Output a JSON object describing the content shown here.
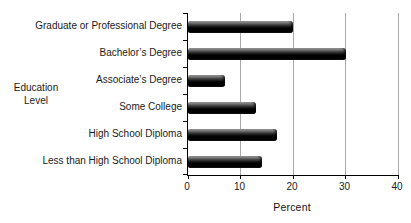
{
  "chart_data": {
    "type": "bar",
    "orientation": "horizontal",
    "title": "",
    "categories": [
      "Graduate or Professional Degree",
      "Bachelor’s Degree",
      "Associate’s Degree",
      "Some College",
      "High School Diploma",
      "Less than High School Diploma"
    ],
    "values": [
      20,
      30,
      7,
      13,
      17,
      14
    ],
    "xlabel": "Percent",
    "ylabel": "Education Level",
    "xlim": [
      0,
      40
    ],
    "xticks": [
      0,
      10,
      20,
      30,
      40
    ],
    "grid": true,
    "legend": "none",
    "bar_color": "#000000",
    "gridline_color": "#a9a9a9",
    "axis_color": "#000000",
    "text_color": "#1a1a1a"
  },
  "labels": {
    "ylabel_line1": "Education",
    "ylabel_line2": "Level",
    "xlabel": "Percent"
  }
}
